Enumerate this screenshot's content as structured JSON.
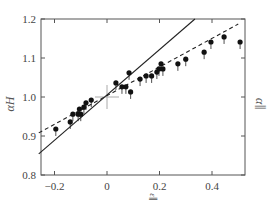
{
  "chart_data": {
    "type": "scatter",
    "title": "",
    "xlabel": "ε∥",
    "ylabel": "αH",
    "ylabel_right": "α∥",
    "xlim": [
      -0.26,
      0.525
    ],
    "ylim": [
      0.8,
      1.2
    ],
    "x_ticks": [
      -0.2,
      0,
      0.2,
      0.4
    ],
    "x_tick_labels": [
      "−0.2",
      "0",
      "0.2",
      "0.4"
    ],
    "y_ticks": [
      0.8,
      0.9,
      1.0,
      1.1,
      1.2
    ],
    "y_tick_labels": [
      "0.8",
      "0.9",
      "1.0",
      "1.1",
      "1.2"
    ],
    "grid": false,
    "legend": null,
    "series": [
      {
        "name": "data",
        "marker": "filled-circle",
        "color": "#111111",
        "points": [
          [
            -0.195,
            0.918
          ],
          [
            -0.14,
            0.936
          ],
          [
            -0.13,
            0.956
          ],
          [
            -0.11,
            0.956
          ],
          [
            -0.105,
            0.969
          ],
          [
            -0.1,
            0.956
          ],
          [
            -0.088,
            0.974
          ],
          [
            -0.08,
            0.985
          ],
          [
            -0.06,
            0.992
          ],
          [
            0.034,
            1.036
          ],
          [
            0.057,
            1.026
          ],
          [
            0.072,
            1.026
          ],
          [
            0.084,
            1.062
          ],
          [
            0.09,
            1.013
          ],
          [
            0.126,
            1.046
          ],
          [
            0.149,
            1.054
          ],
          [
            0.17,
            1.054
          ],
          [
            0.19,
            1.064
          ],
          [
            0.198,
            1.072
          ],
          [
            0.206,
            1.085
          ],
          [
            0.213,
            1.072
          ],
          [
            0.27,
            1.085
          ],
          [
            0.3,
            1.097
          ],
          [
            0.37,
            1.115
          ],
          [
            0.396,
            1.141
          ],
          [
            0.446,
            1.154
          ],
          [
            0.507,
            1.141
          ]
        ]
      },
      {
        "name": "solid-fit",
        "type": "line",
        "style": "solid",
        "color": "#222222",
        "points": [
          [
            -0.26,
            0.854
          ],
          [
            0.335,
            1.2
          ]
        ]
      },
      {
        "name": "dashed-fit",
        "type": "line",
        "style": "dashed",
        "color": "#222222",
        "points": [
          [
            -0.26,
            0.908
          ],
          [
            0.5,
            1.187
          ]
        ]
      }
    ],
    "annotations": [
      {
        "type": "crosshair",
        "x": 0,
        "y": 1.0,
        "color": "#aaaaaa"
      }
    ]
  }
}
